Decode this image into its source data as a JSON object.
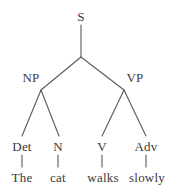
{
  "figure": {
    "name": "constituency-parse-tree",
    "sentence": "The cat walks slowly",
    "background_color": "#ffffff",
    "line_color": "#5a5a5a",
    "text_color": "#3a3a3a"
  },
  "nodes": {
    "root": {
      "label": "S",
      "x": 81,
      "y": 16
    },
    "np": {
      "label": "NP",
      "x": 31,
      "y": 77
    },
    "vp": {
      "label": "VP",
      "x": 135,
      "y": 77
    },
    "det": {
      "label": "Det",
      "x": 22,
      "y": 146
    },
    "n": {
      "label": "N",
      "x": 58,
      "y": 146
    },
    "v": {
      "label": "V",
      "x": 102,
      "y": 146
    },
    "adv": {
      "label": "Adv",
      "x": 146,
      "y": 146
    },
    "word_the": {
      "label": "The",
      "x": 22,
      "y": 177
    },
    "word_cat": {
      "label": "cat",
      "x": 58,
      "y": 177
    },
    "word_walks": {
      "label": "walks",
      "x": 103,
      "y": 177
    },
    "word_slowly": {
      "label": "slowly",
      "x": 147,
      "y": 177
    }
  },
  "edges": [
    {
      "name": "edge-s-stem",
      "x1": 81,
      "y1": 25,
      "x2": 81,
      "y2": 57
    },
    {
      "name": "edge-s-to-np",
      "x1": 81,
      "y1": 57,
      "x2": 41,
      "y2": 90
    },
    {
      "name": "edge-s-to-vp",
      "x1": 81,
      "y1": 57,
      "x2": 124,
      "y2": 90
    },
    {
      "name": "edge-np-to-det",
      "x1": 41,
      "y1": 90,
      "x2": 22,
      "y2": 136
    },
    {
      "name": "edge-np-to-n",
      "x1": 41,
      "y1": 90,
      "x2": 59,
      "y2": 136
    },
    {
      "name": "edge-vp-to-v",
      "x1": 124,
      "y1": 90,
      "x2": 102,
      "y2": 136
    },
    {
      "name": "edge-vp-to-adv",
      "x1": 124,
      "y1": 90,
      "x2": 146,
      "y2": 136
    },
    {
      "name": "edge-det-to-the",
      "x1": 22,
      "y1": 155,
      "x2": 22,
      "y2": 167
    },
    {
      "name": "edge-n-to-cat",
      "x1": 58,
      "y1": 155,
      "x2": 58,
      "y2": 167
    },
    {
      "name": "edge-v-to-walks",
      "x1": 102,
      "y1": 155,
      "x2": 102,
      "y2": 167
    },
    {
      "name": "edge-adv-to-slowly",
      "x1": 146,
      "y1": 155,
      "x2": 146,
      "y2": 167
    }
  ]
}
